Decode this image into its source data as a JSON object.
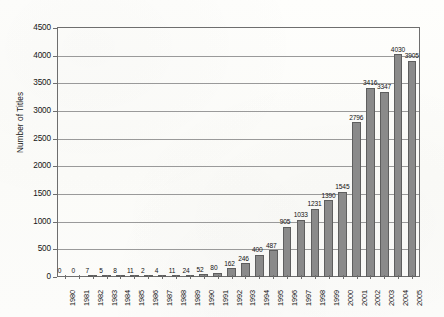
{
  "chart_data": {
    "type": "bar",
    "title": "",
    "xlabel": "",
    "ylabel": "Number of Titles",
    "ylim": [
      0,
      4500
    ],
    "ytick_step": 500,
    "grid": true,
    "legend": "none",
    "categories": [
      "1980",
      "1981",
      "1982",
      "1983",
      "1984",
      "1985",
      "1986",
      "1987",
      "1988",
      "1989",
      "1990",
      "1991",
      "1992",
      "1993",
      "1994",
      "1995",
      "1996",
      "1997",
      "1998",
      "1999",
      "2000",
      "2001",
      "2002",
      "2003",
      "2004",
      "2005"
    ],
    "values": [
      0,
      0,
      7,
      5,
      8,
      11,
      2,
      4,
      11,
      24,
      52,
      80,
      162,
      246,
      400,
      487,
      905,
      1033,
      1231,
      1390,
      1545,
      2796,
      3416,
      3347,
      4030,
      3905
    ],
    "ytick_labels": [
      "0",
      "500",
      "1000",
      "1500",
      "2000",
      "2500",
      "3000",
      "3500",
      "4000",
      "4500"
    ],
    "ytick_values": [
      0,
      500,
      1000,
      1500,
      2000,
      2500,
      3000,
      3500,
      4000,
      4500
    ],
    "data_labels": [
      "0",
      "0",
      "7",
      "5",
      "8",
      "11",
      "2",
      "4",
      "11",
      "24",
      "52",
      "80",
      "162",
      "246",
      "400",
      "487",
      "905",
      "1033",
      "1231",
      "1390",
      "1545",
      "2796",
      "3416",
      "3347",
      "4030",
      "3905"
    ],
    "colors": {
      "bar_fill": "#8a8a8a",
      "bar_stroke": "#5e5e5e",
      "gridline": "#9a9a9a",
      "axis": "#6e6e6e",
      "text": "#121212",
      "background": "#fdfdfb"
    }
  }
}
